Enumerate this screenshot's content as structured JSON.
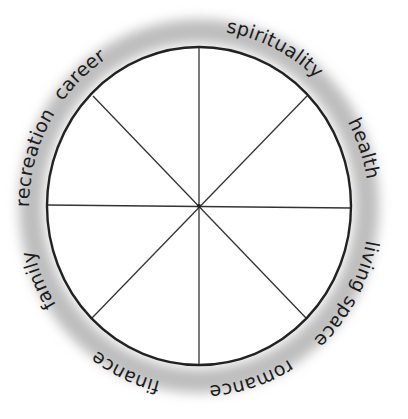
{
  "diagram": {
    "type": "wheel-of-life",
    "segments": 8,
    "center": [
      199,
      206
    ],
    "radius_x": 152,
    "radius_y": 159,
    "colors": {
      "ring": "#222222",
      "spokes": "#333333",
      "halo": "#b8b8b8",
      "text": "#1c1c1c",
      "background": "#ffffff"
    },
    "labels": [
      {
        "id": "career",
        "text": "career"
      },
      {
        "id": "spirituality",
        "text": "spirituality"
      },
      {
        "id": "health",
        "text": "health"
      },
      {
        "id": "living-space",
        "text": "living space"
      },
      {
        "id": "romance",
        "text": "romance"
      },
      {
        "id": "finance",
        "text": "finance"
      },
      {
        "id": "family",
        "text": "family"
      },
      {
        "id": "recreation",
        "text": "recreation"
      }
    ]
  }
}
